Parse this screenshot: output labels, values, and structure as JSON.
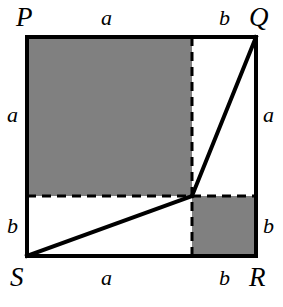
{
  "figure": {
    "colors": {
      "shade": "#808080",
      "stroke": "#000000",
      "background": "#ffffff"
    },
    "geometry": {
      "square": {
        "left": 27,
        "top": 37,
        "right": 256,
        "bottom": 256
      },
      "division_point": {
        "x": 192,
        "y": 196
      },
      "stroke_width_outline": 4,
      "stroke_width_dashed": 3,
      "stroke_width_diagonal": 4,
      "dash_pattern": "9,6"
    },
    "vertices": [
      {
        "id": "P",
        "label": "P",
        "corner": "top-left"
      },
      {
        "id": "Q",
        "label": "Q",
        "corner": "top-right"
      },
      {
        "id": "R",
        "label": "R",
        "corner": "bottom-right"
      },
      {
        "id": "S",
        "label": "S",
        "corner": "bottom-left"
      }
    ],
    "segment_labels": {
      "top_left": "a",
      "top_right": "b",
      "bottom_left": "a",
      "bottom_right": "b",
      "left_upper": "a",
      "left_lower": "b",
      "right_upper": "a",
      "right_lower": "b"
    },
    "shaded_regions": [
      {
        "id": "upper-left-square",
        "x": 27,
        "y": 37,
        "width": 165,
        "height": 159,
        "fill": "#808080"
      },
      {
        "id": "lower-right-square",
        "x": 192,
        "y": 196,
        "width": 64,
        "height": 60,
        "fill": "#808080"
      }
    ],
    "dashed_lines": [
      {
        "id": "vertical-divider",
        "x1": 192,
        "y1": 37,
        "x2": 192,
        "y2": 256
      },
      {
        "id": "horizontal-divider",
        "x1": 27,
        "y1": 196,
        "x2": 256,
        "y2": 196
      }
    ],
    "diagonals": [
      {
        "id": "diagonal-S-to-center",
        "x1": 27,
        "y1": 256,
        "x2": 192,
        "y2": 196
      },
      {
        "id": "diagonal-center-to-Q",
        "x1": 192,
        "y1": 196,
        "x2": 256,
        "y2": 37
      }
    ]
  }
}
